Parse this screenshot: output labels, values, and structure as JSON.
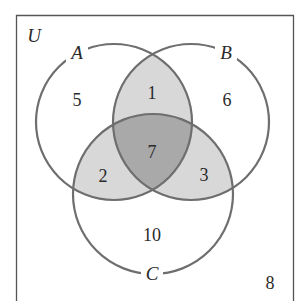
{
  "diagram": {
    "type": "venn-3-set",
    "universe": {
      "label": "U",
      "outside_count": "8"
    },
    "sets": [
      {
        "id": "A",
        "label": "A"
      },
      {
        "id": "B",
        "label": "B"
      },
      {
        "id": "C",
        "label": "C"
      }
    ],
    "regions": {
      "only_A": "5",
      "only_B": "6",
      "only_C": "10",
      "A_and_B_only": "1",
      "A_and_C_only": "2",
      "B_and_C_only": "3",
      "A_and_B_and_C": "7",
      "outside": "8"
    },
    "colors": {
      "background": "#ffffff",
      "outline": "#6e6e6e",
      "frame": "#555555",
      "pairwise_fill": "#d8d8d8",
      "triple_fill": "#a9a9a9",
      "text": "#2a2a2a"
    }
  }
}
